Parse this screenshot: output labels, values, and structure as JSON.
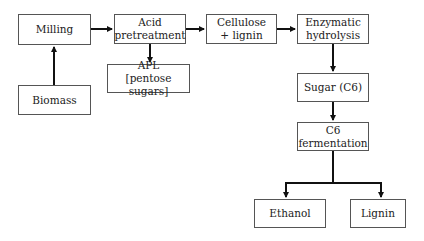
{
  "diagram": {
    "type": "flowchart",
    "nodes": [
      {
        "id": "milling",
        "lines": [
          "Milling"
        ]
      },
      {
        "id": "acid",
        "lines": [
          "Acid",
          "pretreatment"
        ]
      },
      {
        "id": "cellulose",
        "lines": [
          "Cellulose",
          "+ lignin"
        ]
      },
      {
        "id": "enzymatic",
        "lines": [
          "Enzymatic",
          "hydrolysis"
        ]
      },
      {
        "id": "biomass",
        "lines": [
          "Biomass"
        ]
      },
      {
        "id": "apl",
        "lines": [
          "APL",
          "[pentose sugars]"
        ]
      },
      {
        "id": "sugar",
        "lines": [
          "Sugar (C6)"
        ]
      },
      {
        "id": "c6",
        "lines": [
          "C6",
          "fermentation"
        ]
      },
      {
        "id": "ethanol",
        "lines": [
          "Ethanol"
        ]
      },
      {
        "id": "lignin",
        "lines": [
          "Lignin"
        ]
      }
    ],
    "edges": [
      {
        "from": "biomass",
        "to": "milling"
      },
      {
        "from": "milling",
        "to": "acid"
      },
      {
        "from": "acid",
        "to": "cellulose"
      },
      {
        "from": "acid",
        "to": "apl"
      },
      {
        "from": "cellulose",
        "to": "enzymatic"
      },
      {
        "from": "enzymatic",
        "to": "sugar"
      },
      {
        "from": "sugar",
        "to": "c6"
      },
      {
        "from": "c6",
        "to": "ethanol"
      },
      {
        "from": "c6",
        "to": "lignin"
      }
    ],
    "colors": {
      "line": "#111111",
      "border": "#555555",
      "text": "#222222"
    }
  }
}
